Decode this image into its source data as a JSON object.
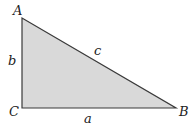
{
  "diagram": {
    "vertices": {
      "A": "A",
      "B": "B",
      "C": "C"
    },
    "sides": {
      "a": "a",
      "b": "b",
      "c": "c"
    },
    "right_angle_at": "C",
    "colors": {
      "fill": "#d9d9d9",
      "stroke": "#3a3a3a",
      "label": "#222222"
    }
  }
}
